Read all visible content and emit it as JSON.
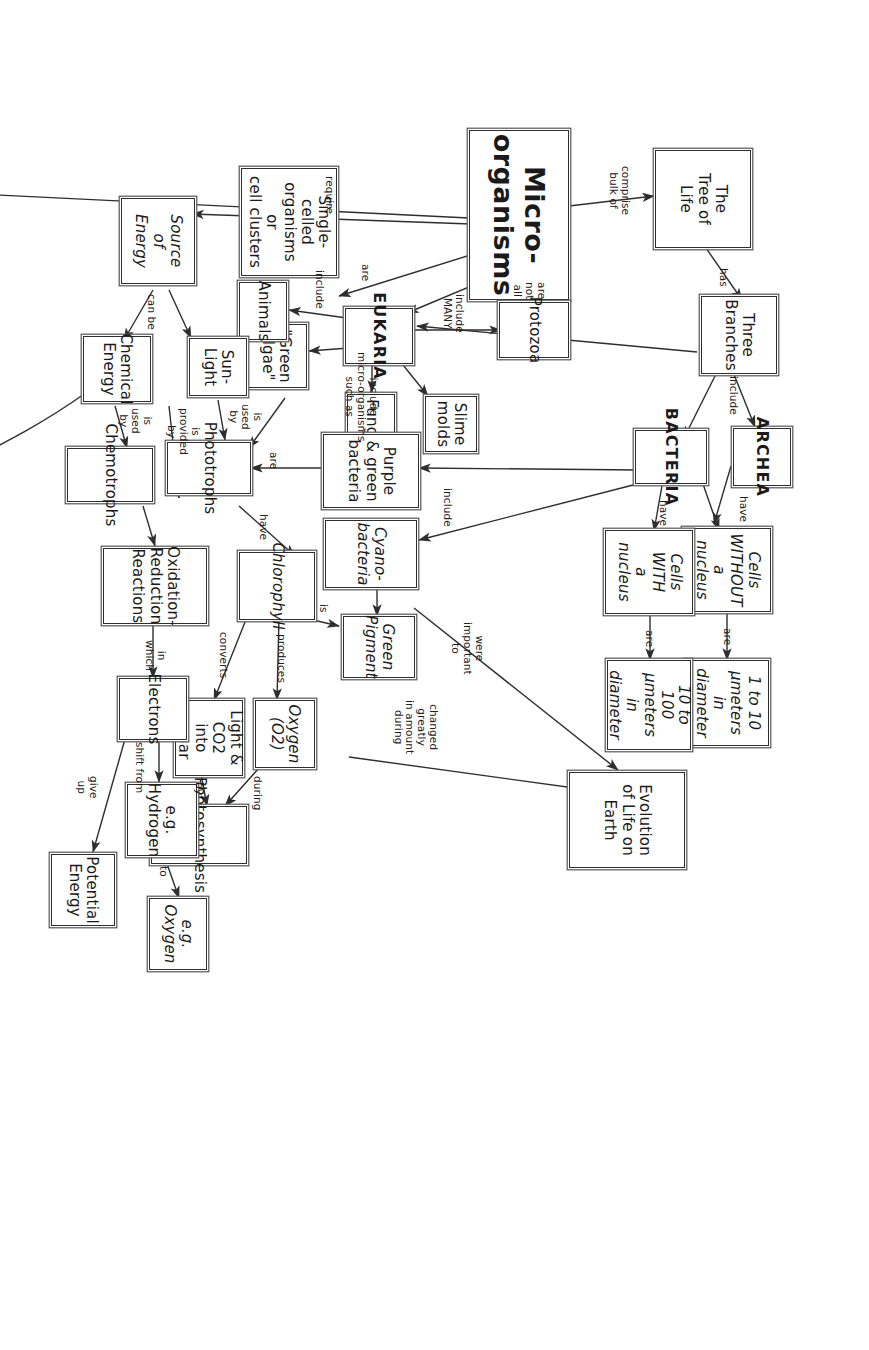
{
  "diagram": {
    "root_label": "Micro-organisms",
    "stroke_color": "#2e2e2e",
    "background": "#ffffff"
  },
  "nodes": [
    {
      "id": "micro",
      "label": "Micro-organisms"
    },
    {
      "id": "treeoflife",
      "label": "The\nTree of\nLife"
    },
    {
      "id": "threebranches",
      "label": "Three\nBranches"
    },
    {
      "id": "archea",
      "label": "ARCHEA"
    },
    {
      "id": "bacteria",
      "label": "BACTERIA"
    },
    {
      "id": "eukaria",
      "label": "EUKARIA"
    },
    {
      "id": "cellswithout",
      "label": "Cells\nWITHOUT\na nucleus"
    },
    {
      "id": "cellswith",
      "label": "Cells\nWITH\na nucleus"
    },
    {
      "id": "size1to10",
      "label": "1 to 10\nμmeters\nin diameter"
    },
    {
      "id": "size10to100",
      "label": "10 to 100\nμmeters\nin diameter"
    },
    {
      "id": "evolution",
      "label": "Evolution\nof Life on Earth"
    },
    {
      "id": "protozoa",
      "label": "Protozoa"
    },
    {
      "id": "slimemolds",
      "label": "Slime\nmolds"
    },
    {
      "id": "fungi",
      "label": "Fungi"
    },
    {
      "id": "greenalgae",
      "label": "\"Green\nalgae\""
    },
    {
      "id": "animals",
      "label": "Animals"
    },
    {
      "id": "singlecelled",
      "label": "Single-celled\norganisms or\ncell clusters"
    },
    {
      "id": "purplegreen",
      "label": "Purple\n& green\nbacteria"
    },
    {
      "id": "cyanobacteria",
      "label": "Cyano-\nbacteria"
    },
    {
      "id": "greenpigment",
      "label": "Green\nPigment"
    },
    {
      "id": "chlorophyll",
      "label": "Chlorophyll"
    },
    {
      "id": "oxygen",
      "label": "Oxygen\n(O2)"
    },
    {
      "id": "lightco2",
      "label": "Light & CO2\ninto sugar"
    },
    {
      "id": "photosynthesis",
      "label": "Photosynthesis"
    },
    {
      "id": "phototrophs",
      "label": "Phototrophs"
    },
    {
      "id": "chemotrophs",
      "label": "Chemotrophs"
    },
    {
      "id": "sourceenergy",
      "label": "Source\nof Energy"
    },
    {
      "id": "sunlight",
      "label": "Sun-\nLight"
    },
    {
      "id": "chemenergy",
      "label": "Chemical\nEnergy"
    },
    {
      "id": "redox",
      "label": "Oxidation-\nReduction\nReactions"
    },
    {
      "id": "electrons",
      "label": "Electrons"
    },
    {
      "id": "eghydrogen",
      "label": "e.g. Hydrogen"
    },
    {
      "id": "egoxygen",
      "label": "e.g. Oxygen"
    },
    {
      "id": "potential",
      "label": "Potential\nEnergy"
    },
    {
      "id": "sourcecarbon",
      "label": "Source\nof Carbon"
    },
    {
      "id": "co2inorg",
      "label": "CO2\n(inorganic)"
    },
    {
      "id": "organiccarbon",
      "label": "Organic\ncarbon"
    },
    {
      "id": "autotrophs",
      "label": "Autotrophs"
    },
    {
      "id": "heterotrophs",
      "label": "Heterotrophs"
    },
    {
      "id": "chemoauto",
      "label": "Chemo-auto-\nlithotrophs"
    },
    {
      "id": "earthcrust",
      "label": "Deep inside\nEarth's Crust"
    },
    {
      "id": "martiancrust",
      "label": "Deep inside\nMartian Crust"
    }
  ],
  "link_labels": [
    {
      "id": "l-comprise",
      "text": "comprise\nbulk of"
    },
    {
      "id": "l-has",
      "text": "has"
    },
    {
      "id": "l-include1",
      "text": "include"
    },
    {
      "id": "l-have-a",
      "text": "have"
    },
    {
      "id": "l-have-b",
      "text": "have"
    },
    {
      "id": "l-are-a",
      "text": "are"
    },
    {
      "id": "l-are-b",
      "text": "are"
    },
    {
      "id": "l-arenotall",
      "text": "are\nnot\nall"
    },
    {
      "id": "l-includemany",
      "text": "include\nMANY"
    },
    {
      "id": "l-are-c",
      "text": "are"
    },
    {
      "id": "l-include2",
      "text": "include"
    },
    {
      "id": "l-includemicro",
      "text": "include\nmicro-organisms\nsuch as"
    },
    {
      "id": "l-include3",
      "text": "include"
    },
    {
      "id": "l-important",
      "text": "were\nimportant\nto"
    },
    {
      "id": "l-changed",
      "text": "changed\ngreatly\nin amount\nduring"
    },
    {
      "id": "l-is",
      "text": "is"
    },
    {
      "id": "l-produces",
      "text": "produces"
    },
    {
      "id": "l-converts",
      "text": "converts"
    },
    {
      "id": "l-during",
      "text": "during"
    },
    {
      "id": "l-by",
      "text": "by"
    },
    {
      "id": "l-have-c",
      "text": "have"
    },
    {
      "id": "l-are-d",
      "text": "are"
    },
    {
      "id": "l-require",
      "text": "require"
    },
    {
      "id": "l-canbe1",
      "text": "can be"
    },
    {
      "id": "l-isusedby1",
      "text": "is\nused\nby"
    },
    {
      "id": "l-isprovided",
      "text": "is\nprovided\nby"
    },
    {
      "id": "l-isusedby2",
      "text": "is\nused\nby"
    },
    {
      "id": "l-inwhich",
      "text": "in\nwhich"
    },
    {
      "id": "l-shiftfrom",
      "text": "shift from"
    },
    {
      "id": "l-to",
      "text": "to"
    },
    {
      "id": "l-giveup",
      "text": "give\nup"
    },
    {
      "id": "l-canbe2",
      "text": "can\nbe"
    },
    {
      "id": "l-isusedby3",
      "text": "is\nused\nby"
    },
    {
      "id": "l-isusedby4",
      "text": "is\nused\nby"
    },
    {
      "id": "l-discovered",
      "text": "have been\ndiscovered"
    },
    {
      "id": "l-mightbe",
      "text": "might be\nable to\nsurvive"
    }
  ]
}
